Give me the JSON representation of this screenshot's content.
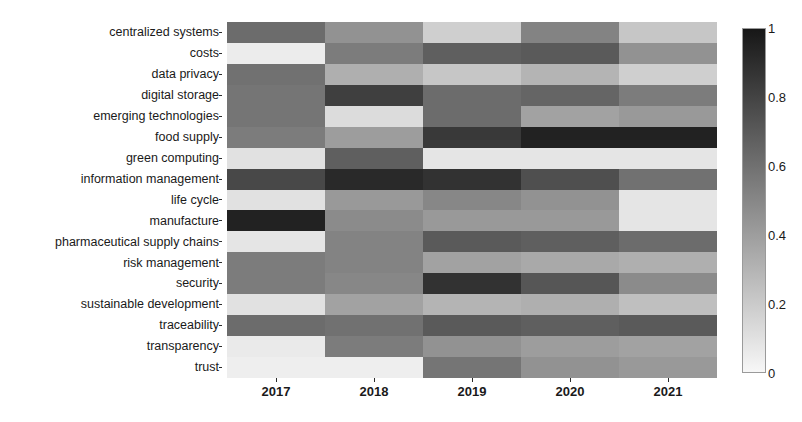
{
  "chart_data": {
    "type": "heatmap",
    "title": "",
    "xlabel": "",
    "ylabel": "",
    "grid": false,
    "legend_position": "right",
    "categories_x": [
      "2017",
      "2018",
      "2019",
      "2020",
      "2021"
    ],
    "categories_y": [
      "centralized systems",
      "costs",
      "data privacy",
      "digital storage",
      "emerging technologies",
      "food supply",
      "green computing",
      "information management",
      "life cycle",
      "manufacture",
      "pharmaceutical supply chains",
      "risk management",
      "security",
      "sustainable development",
      "traceability",
      "transparency",
      "trust"
    ],
    "colormap": "greys",
    "colorbar": {
      "min": 0,
      "max": 1,
      "ticks": [
        1,
        0.8,
        0.6,
        0.4,
        0.2,
        0
      ],
      "tick_labels": [
        "1",
        "0.8",
        "0.6",
        "0.4",
        "0.2",
        "0"
      ],
      "low_color": "#f7f7f7",
      "high_color": "#1b1b1b"
    },
    "zlim": [
      0,
      1
    ],
    "values": [
      [
        0.62,
        0.45,
        0.18,
        0.52,
        0.22
      ],
      [
        0.05,
        0.55,
        0.68,
        0.7,
        0.45
      ],
      [
        0.6,
        0.32,
        0.22,
        0.3,
        0.18
      ],
      [
        0.58,
        0.82,
        0.62,
        0.65,
        0.55
      ],
      [
        0.58,
        0.12,
        0.62,
        0.38,
        0.42
      ],
      [
        0.55,
        0.4,
        0.85,
        0.95,
        0.95
      ],
      [
        0.1,
        0.68,
        0.08,
        0.08,
        0.08
      ],
      [
        0.78,
        0.92,
        0.88,
        0.75,
        0.6
      ],
      [
        0.1,
        0.42,
        0.5,
        0.45,
        0.08
      ],
      [
        0.95,
        0.48,
        0.42,
        0.42,
        0.08
      ],
      [
        0.08,
        0.52,
        0.7,
        0.68,
        0.62
      ],
      [
        0.55,
        0.52,
        0.38,
        0.35,
        0.32
      ],
      [
        0.55,
        0.5,
        0.88,
        0.72,
        0.48
      ],
      [
        0.1,
        0.38,
        0.3,
        0.32,
        0.25
      ],
      [
        0.62,
        0.6,
        0.7,
        0.68,
        0.7
      ],
      [
        0.06,
        0.55,
        0.45,
        0.4,
        0.38
      ],
      [
        0.04,
        0.04,
        0.58,
        0.45,
        0.42
      ]
    ]
  }
}
